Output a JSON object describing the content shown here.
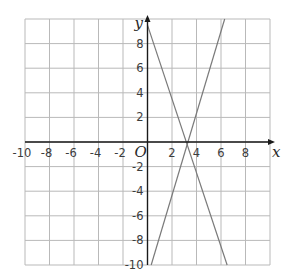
{
  "chart_data": {
    "type": "line",
    "title": "",
    "xlabel": "x",
    "ylabel": "y",
    "origin_label": "O",
    "xlim": [
      -10,
      10
    ],
    "ylim": [
      -10,
      10
    ],
    "grid": true,
    "grid_step": 2,
    "x_ticks": [
      -10,
      -8,
      -6,
      -4,
      -2,
      2,
      4,
      6,
      8
    ],
    "y_ticks": [
      8,
      6,
      4,
      2,
      -2,
      -4,
      -6,
      -8,
      -10
    ],
    "x_tick_labels": [
      "-10",
      "-8",
      "-6",
      "-4",
      "-2",
      "2",
      "4",
      "6",
      "8"
    ],
    "y_tick_labels": [
      "8",
      "6",
      "4",
      "2",
      "-2",
      "-4",
      "-6",
      "-8",
      "-10"
    ],
    "series": [
      {
        "name": "rising-line",
        "x": [
          0.3,
          6.3
        ],
        "y": [
          -10,
          10
        ],
        "color": "#7a7a7a"
      },
      {
        "name": "falling-line",
        "x": [
          0,
          6.5
        ],
        "y": [
          9.5,
          -10
        ],
        "color": "#7a7a7a"
      }
    ],
    "colors": {
      "grid": "#b9b9b9",
      "axis": "#1a1a1a",
      "text": "#3c3c3c"
    }
  }
}
